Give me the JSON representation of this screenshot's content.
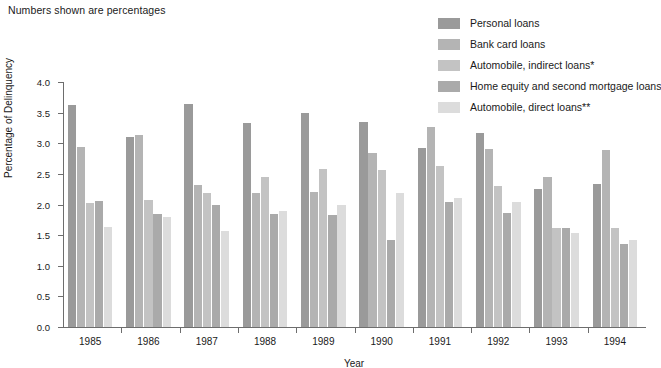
{
  "caption": "Numbers shown are percentages",
  "legend": {
    "position": "top-right",
    "items": [
      {
        "label": "Personal loans",
        "color": "#9a9a9a"
      },
      {
        "label": "Bank card loans",
        "color": "#b4b4b4"
      },
      {
        "label": "Automobile, indirect loans*",
        "color": "#c3c3c3"
      },
      {
        "label": "Home equity and second mortgage loans",
        "color": "#aaaaaa"
      },
      {
        "label": "Automobile, direct loans**",
        "color": "#dcdcdc"
      }
    ]
  },
  "chart_data": {
    "type": "bar",
    "title": "",
    "subtitle": "Numbers shown are percentages",
    "xlabel": "Year",
    "ylabel": "Percentage of Delinquency",
    "ylim": [
      0.0,
      4.0
    ],
    "ytick_labels": [
      "0.0",
      "0.5",
      "1.0",
      "1.5",
      "2.0",
      "2.5",
      "3.0",
      "3.5",
      "4.0"
    ],
    "ytick_values": [
      0.0,
      0.5,
      1.0,
      1.5,
      2.0,
      2.5,
      3.0,
      3.5,
      4.0
    ],
    "grid": false,
    "legend_position": "top-right",
    "categories": [
      "1985",
      "1986",
      "1987",
      "1988",
      "1989",
      "1990",
      "1991",
      "1992",
      "1993",
      "1994"
    ],
    "series": [
      {
        "name": "Personal loans",
        "color": "#9a9a9a",
        "values": [
          3.62,
          3.11,
          3.64,
          3.33,
          3.5,
          3.35,
          2.93,
          3.16,
          2.26,
          2.34
        ]
      },
      {
        "name": "Bank card loans",
        "color": "#b4b4b4",
        "values": [
          2.94,
          3.14,
          2.32,
          2.18,
          2.21,
          2.84,
          3.27,
          2.9,
          2.45,
          2.89
        ]
      },
      {
        "name": "Automobile, indirect loans*",
        "color": "#c3c3c3",
        "values": [
          2.02,
          2.07,
          2.19,
          2.45,
          2.58,
          2.56,
          2.63,
          2.3,
          1.61,
          1.61
        ]
      },
      {
        "name": "Home equity and second mortgage loans",
        "color": "#aaaaaa",
        "values": [
          2.05,
          1.84,
          2.0,
          1.84,
          1.83,
          1.42,
          2.04,
          1.86,
          1.62,
          1.35
        ]
      },
      {
        "name": "Automobile, direct loans**",
        "color": "#dcdcdc",
        "values": [
          1.63,
          1.79,
          1.57,
          1.9,
          2.0,
          2.18,
          2.11,
          2.04,
          1.54,
          1.42
        ]
      }
    ]
  },
  "axis_colors": {
    "line": "#6d6d6d",
    "text": "#1a1a1a"
  }
}
